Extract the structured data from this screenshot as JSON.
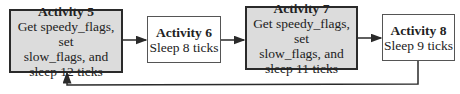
{
  "diagram": {
    "activities": [
      {
        "title": "Activity 5",
        "lines": [
          "Get speedy_flags, set",
          "slow_flags, and",
          "sleep 12 ticks"
        ],
        "highlighted": true
      },
      {
        "title": "Activity 6",
        "lines": [
          "Sleep 8 ticks"
        ],
        "highlighted": false
      },
      {
        "title": "Activity 7",
        "lines": [
          "Get speedy_flags, set",
          "slow_flags, and",
          "sleep 11 ticks"
        ],
        "highlighted": true
      },
      {
        "title": "Activity 8",
        "lines": [
          "Sleep 9 ticks"
        ],
        "highlighted": false
      }
    ],
    "edges": [
      {
        "from": "Activity 5",
        "to": "Activity 6"
      },
      {
        "from": "Activity 6",
        "to": "Activity 7"
      },
      {
        "from": "Activity 7",
        "to": "Activity 8"
      },
      {
        "from": "Activity 8",
        "to": "Activity 5",
        "type": "loop-back"
      }
    ],
    "colors": {
      "highlight_fill": "#dcdcdc",
      "border": "#2a2a2a"
    }
  }
}
